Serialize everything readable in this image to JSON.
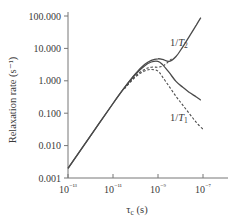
{
  "chart_data": {
    "type": "line",
    "title": "",
    "xlabel": "τc (s)",
    "ylabel": "Relaxation rate (s⁻¹)",
    "xscale": "log",
    "yscale": "log",
    "xlim": [
      1e-13,
      3e-07
    ],
    "ylim": [
      0.001,
      100
    ],
    "x_ticks": [
      "10⁻¹³",
      "10⁻¹¹",
      "10⁻⁹",
      "10⁻⁷"
    ],
    "y_ticks": [
      "0.001",
      "0.010",
      "0.100",
      "1.000",
      "10.000",
      "100.000"
    ],
    "grid": false,
    "annotations": [
      "1/T2",
      "1/T1"
    ],
    "series": [
      {
        "name": "1/T2 (solid)",
        "style": "solid",
        "log10_x": [
          -13,
          -12,
          -11,
          -10.5,
          -10,
          -9.6,
          -9.3,
          -9.0,
          -8.8,
          -8.5,
          -8.2,
          -7.9,
          -7.6,
          -7.3,
          -7.1
        ],
        "log10_y": [
          -2.7,
          -1.7,
          -0.7,
          -0.22,
          0.22,
          0.5,
          0.63,
          0.68,
          0.66,
          0.6,
          0.75,
          1.05,
          1.38,
          1.72,
          1.95
        ]
      },
      {
        "name": "1/T1 (solid)",
        "style": "solid",
        "log10_x": [
          -13,
          -12,
          -11,
          -10.5,
          -10,
          -9.6,
          -9.3,
          -9.0,
          -8.8,
          -8.5,
          -8.2,
          -7.9,
          -7.6,
          -7.3,
          -7.1
        ],
        "log10_y": [
          -2.7,
          -1.7,
          -0.7,
          -0.22,
          0.2,
          0.46,
          0.58,
          0.6,
          0.5,
          0.25,
          -0.02,
          -0.2,
          -0.36,
          -0.5,
          -0.6
        ]
      },
      {
        "name": "1/T2 (dashed)",
        "style": "dashed",
        "log10_x": [
          -10.5,
          -10,
          -9.6,
          -9.3,
          -9.0,
          -8.8,
          -8.6,
          -8.4
        ],
        "log10_y": [
          -0.24,
          0.15,
          0.35,
          0.42,
          0.42,
          0.45,
          0.55,
          0.68
        ]
      },
      {
        "name": "1/T1 (dashed)",
        "style": "dashed",
        "log10_x": [
          -10.5,
          -10,
          -9.6,
          -9.3,
          -9.0,
          -8.8,
          -8.5,
          -8.2,
          -7.9,
          -7.6,
          -7.3,
          -7.0
        ],
        "log10_y": [
          -0.25,
          0.12,
          0.3,
          0.35,
          0.3,
          0.12,
          -0.18,
          -0.48,
          -0.75,
          -1.02,
          -1.28,
          -1.5
        ]
      }
    ]
  },
  "axes": {
    "ylabel": "Relaxation rate (s⁻¹)",
    "xlabel_main": "τ",
    "xlabel_sub": "c",
    "xlabel_unit": " (s)"
  },
  "labels": {
    "t2": {
      "prefix": "1/",
      "var": "T",
      "sub": "2"
    },
    "t1": {
      "prefix": "1/",
      "var": "T",
      "sub": "1"
    }
  },
  "colors": {
    "line": "#4a4a4a",
    "axis": "#777777",
    "text": "#3a3a3a"
  }
}
